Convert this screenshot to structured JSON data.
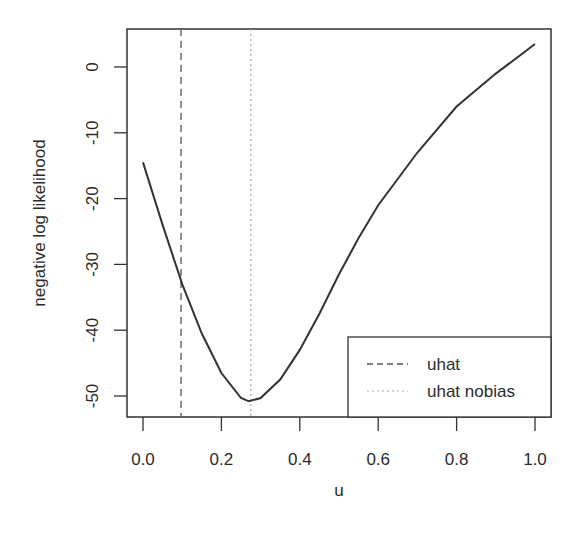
{
  "chart_data": {
    "type": "line",
    "title": "",
    "xlabel": "u",
    "ylabel": "negative log likelihood",
    "xlim": [
      0.0,
      1.0
    ],
    "ylim": [
      -53,
      6
    ],
    "x_ticks": [
      "0.0",
      "0.2",
      "0.4",
      "0.6",
      "0.8",
      "1.0"
    ],
    "y_ticks": [
      "0",
      "-10",
      "-20",
      "-30",
      "-40",
      "-50"
    ],
    "grid": false,
    "legend_position": "bottomright",
    "series": [
      {
        "name": "negative log likelihood",
        "style": "solid",
        "x": [
          0.0,
          0.05,
          0.1,
          0.15,
          0.2,
          0.25,
          0.27,
          0.3,
          0.35,
          0.4,
          0.45,
          0.5,
          0.55,
          0.6,
          0.7,
          0.8,
          0.9,
          1.0
        ],
        "values": [
          -14.5,
          -24,
          -33,
          -40.5,
          -46.5,
          -50.3,
          -50.8,
          -50.3,
          -47.5,
          -43,
          -37.5,
          -31.5,
          -26,
          -21,
          -13,
          -6,
          -1,
          3.5
        ]
      }
    ],
    "vlines": [
      {
        "name": "uhat",
        "x": 0.097,
        "style": "dashed"
      },
      {
        "name": "uhat nobias",
        "x": 0.275,
        "style": "dotted"
      }
    ],
    "legend": [
      {
        "label": "uhat",
        "style": "dashed"
      },
      {
        "label": "uhat nobias",
        "style": "dotted"
      }
    ]
  },
  "colors": {
    "curve": "#333333",
    "axis": "#333333",
    "dashed_line": "#555555",
    "dotted_line": "#aaaaaa"
  }
}
